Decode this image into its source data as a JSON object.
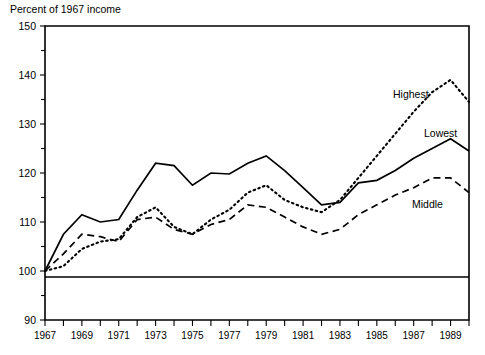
{
  "chart_data": {
    "type": "line",
    "title": "Percent of 1967 income",
    "xlabel": "",
    "ylabel": "Percent of 1967 income",
    "ylim": [
      90,
      150
    ],
    "xlim": [
      1967,
      1990
    ],
    "y_ticks_major": [
      90,
      100,
      110,
      120,
      130,
      140,
      150
    ],
    "y_ticks_minor": [
      95,
      105,
      115,
      125,
      135,
      145
    ],
    "x_ticks": [
      1967,
      1968,
      1969,
      1970,
      1971,
      1972,
      1973,
      1974,
      1975,
      1976,
      1977,
      1978,
      1979,
      1980,
      1981,
      1982,
      1983,
      1984,
      1985,
      1986,
      1987,
      1988,
      1989,
      1990
    ],
    "x_tick_labels": [
      "1967",
      "",
      "1969",
      "",
      "1971",
      "",
      "1973",
      "",
      "1975",
      "",
      "1977",
      "",
      "1979",
      "",
      "1981",
      "",
      "1983",
      "",
      "1985",
      "",
      "1987",
      "",
      "1989",
      ""
    ],
    "grid": false,
    "legend_position": "inline-annotation",
    "reference_line": 100,
    "x": [
      1967,
      1968,
      1969,
      1970,
      1971,
      1972,
      1973,
      1974,
      1975,
      1976,
      1977,
      1978,
      1979,
      1980,
      1981,
      1982,
      1983,
      1984,
      1985,
      1986,
      1987,
      1988,
      1989,
      1990
    ],
    "series": [
      {
        "name": "Lowest",
        "style": "solid",
        "label": "Lowest",
        "values": [
          100.0,
          107.5,
          111.5,
          110.0,
          110.5,
          116.5,
          122.0,
          121.5,
          117.5,
          120.0,
          119.8,
          122.0,
          123.5,
          120.5,
          117.0,
          113.5,
          114.0,
          118.0,
          118.5,
          120.5,
          123.0,
          125.0,
          127.0,
          124.5
        ]
      },
      {
        "name": "Middle",
        "style": "dashed",
        "label": "Middle",
        "values": [
          100.0,
          103.5,
          107.5,
          107.0,
          106.0,
          110.5,
          111.0,
          108.5,
          107.5,
          109.5,
          110.5,
          113.5,
          113.0,
          111.0,
          109.0,
          107.5,
          108.5,
          111.5,
          113.5,
          115.5,
          117.0,
          119.0,
          119.0,
          116.0
        ]
      },
      {
        "name": "Highest",
        "style": "dotted",
        "label": "Highest",
        "values": [
          100.0,
          101.0,
          104.5,
          106.0,
          106.5,
          111.0,
          113.0,
          109.0,
          107.5,
          110.5,
          112.5,
          116.0,
          117.5,
          114.5,
          113.0,
          112.0,
          114.5,
          119.0,
          123.5,
          128.0,
          132.5,
          136.5,
          139.0,
          134.5
        ]
      }
    ],
    "annotations": [
      {
        "text": "Highest",
        "series": "Highest"
      },
      {
        "text": "Lowest",
        "series": "Lowest"
      },
      {
        "text": "Middle",
        "series": "Middle"
      }
    ]
  },
  "colors": {
    "ink": "#000000",
    "background": "#ffffff"
  }
}
